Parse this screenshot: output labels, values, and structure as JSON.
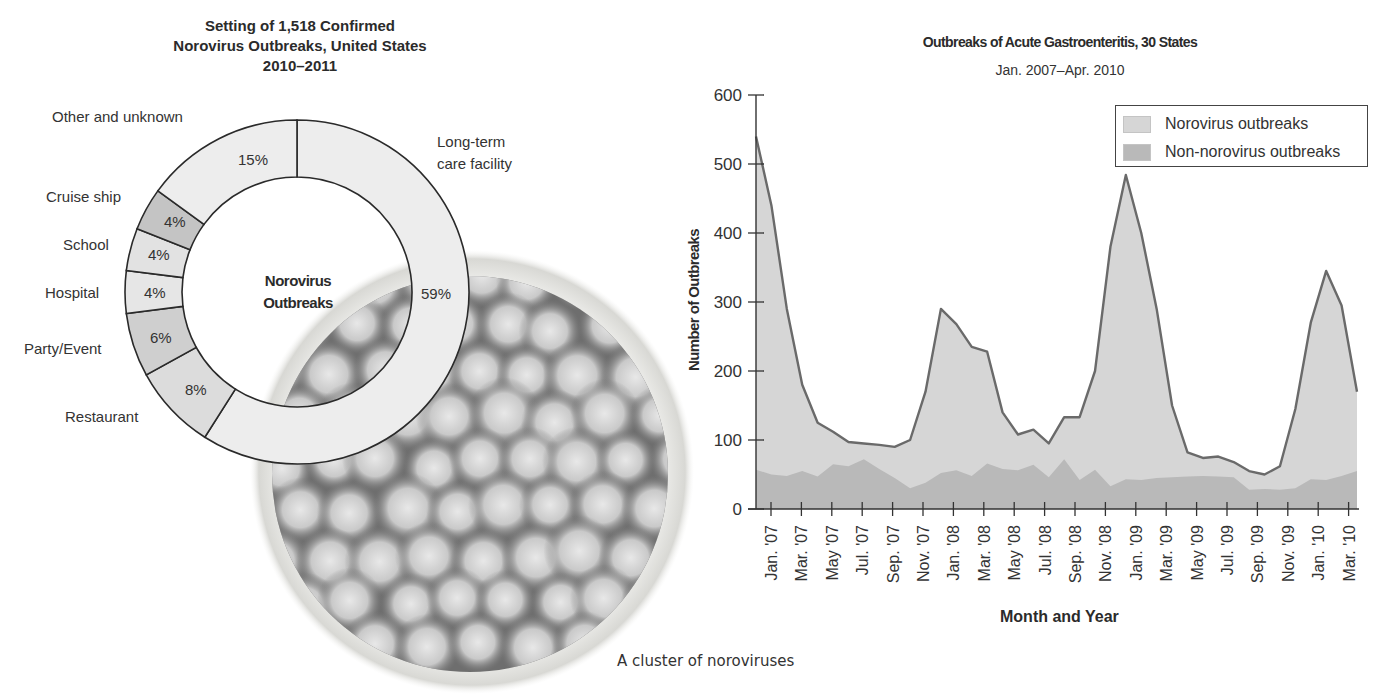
{
  "donut": {
    "title_lines": [
      "Setting of 1,518 Confirmed",
      "Norovirus Outbreaks, United States",
      "2010–2011"
    ],
    "center_label_lines": [
      "Norovirus",
      "Outbreaks"
    ],
    "segments": [
      {
        "label": "Long-term care facility",
        "label_lines": [
          "Long-term",
          "care facility"
        ],
        "value": 59,
        "pct_text": "59%",
        "color": "#ededed"
      },
      {
        "label": "Restaurant",
        "value": 8,
        "pct_text": "8%",
        "color": "#dcdcdc"
      },
      {
        "label": "Party/Event",
        "value": 6,
        "pct_text": "6%",
        "color": "#cfcfcf"
      },
      {
        "label": "Hospital",
        "value": 4,
        "pct_text": "4%",
        "color": "#e6e6e6"
      },
      {
        "label": "School",
        "value": 4,
        "pct_text": "4%",
        "color": "#e2e2e2"
      },
      {
        "label": "Cruise ship",
        "value": 4,
        "pct_text": "4%",
        "color": "#c4c4c4"
      },
      {
        "label": "Other and unknown",
        "value": 15,
        "pct_text": "15%",
        "color": "#ededed"
      }
    ]
  },
  "photo": {
    "caption": "A cluster of noroviruses"
  },
  "chart_data": [
    {
      "type": "pie",
      "title": "Setting of 1,518 Confirmed Norovirus Outbreaks, United States 2010–2011",
      "center_label": "Norovirus Outbreaks",
      "categories": [
        "Long-term care facility",
        "Restaurant",
        "Party/Event",
        "Hospital",
        "School",
        "Cruise ship",
        "Other and unknown"
      ],
      "values": [
        59,
        8,
        6,
        4,
        4,
        4,
        15
      ],
      "unit": "%"
    },
    {
      "type": "area",
      "title": "Outbreaks of Acute Gastroenteritis, 30 States",
      "subtitle": "Jan. 2007–Apr. 2010",
      "xlabel": "Month and Year",
      "ylabel": "Number of Outbreaks",
      "ylim": [
        0,
        600
      ],
      "yticks": [
        0,
        100,
        200,
        300,
        400,
        500,
        600
      ],
      "xtick_labels": [
        "Jan. '07",
        "Mar. '07",
        "May '07",
        "Jul. '07",
        "Sep. '07",
        "Nov. '07",
        "Jan. '08",
        "Mar. '08",
        "May '08",
        "Jul. '08",
        "Sep. '08",
        "Nov. '08",
        "Jan. '09",
        "Mar. '09",
        "May '09",
        "Jul. '09",
        "Sep. '09",
        "Nov. '09",
        "Jan. '10",
        "Mar. '10"
      ],
      "legend": [
        "Norovirus outbreaks",
        "Non-norovirus outbreaks"
      ],
      "legend_position": "upper right",
      "grid": false,
      "x": [
        "Jan 07",
        "Feb 07",
        "Mar 07",
        "Apr 07",
        "May 07",
        "Jun 07",
        "Jul 07",
        "Aug 07",
        "Sep 07",
        "Oct 07",
        "Nov 07",
        "Dec 07",
        "Jan 08",
        "Feb 08",
        "Mar 08",
        "Apr 08",
        "May 08",
        "Jun 08",
        "Jul 08",
        "Aug 08",
        "Sep 08",
        "Oct 08",
        "Nov 08",
        "Dec 08",
        "Jan 09",
        "Feb 09",
        "Mar 09",
        "Apr 09",
        "May 09",
        "Jun 09",
        "Jul 09",
        "Aug 09",
        "Sep 09",
        "Oct 09",
        "Nov 09",
        "Dec 09",
        "Jan 10",
        "Feb 10",
        "Mar 10",
        "Apr 10"
      ],
      "series": [
        {
          "name": "Total (Norovirus + Non-norovirus) outbreaks",
          "values": [
            540,
            440,
            290,
            180,
            125,
            112,
            97,
            95,
            93,
            90,
            100,
            170,
            290,
            268,
            235,
            228,
            140,
            108,
            115,
            95,
            133,
            133,
            200,
            380,
            484,
            400,
            290,
            150,
            82,
            74,
            76,
            68,
            55,
            50,
            62,
            145,
            270,
            345,
            295,
            170
          ]
        },
        {
          "name": "Non-norovirus outbreaks",
          "values": [
            57,
            50,
            48,
            55,
            47,
            65,
            62,
            72,
            58,
            45,
            30,
            38,
            52,
            56,
            48,
            66,
            58,
            56,
            64,
            46,
            72,
            42,
            57,
            33,
            43,
            42,
            45,
            46,
            47,
            48,
            47,
            46,
            28,
            29,
            28,
            30,
            43,
            42,
            48,
            55
          ]
        }
      ]
    }
  ],
  "area_chart": {
    "title": "Outbreaks of Acute Gastroenteritis, 30 States",
    "subtitle": "Jan. 2007–Apr. 2010",
    "ylabel": "Number of Outbreaks",
    "xlabel": "Month and Year",
    "legend": [
      {
        "label": "Norovirus outbreaks",
        "color": "#d6d6d6"
      },
      {
        "label": "Non-norovirus outbreaks",
        "color": "#b9b9b9"
      }
    ],
    "line_color": "#6a6a6a"
  }
}
